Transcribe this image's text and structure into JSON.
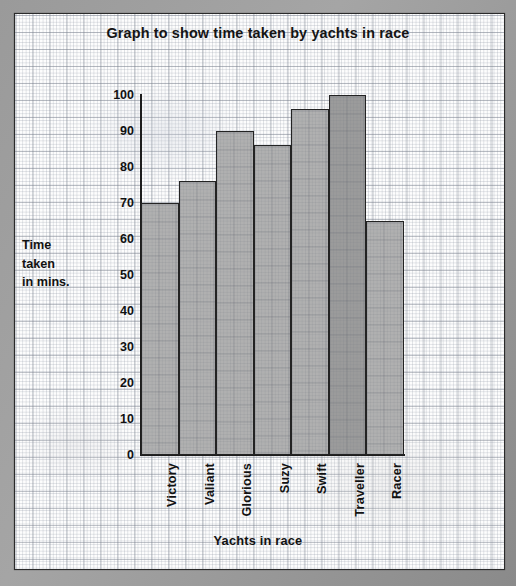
{
  "chart_data": {
    "type": "bar",
    "title": "Graph to show time taken by yachts in race",
    "xlabel": "Yachts in race",
    "ylabel": "Time taken in mins.",
    "ylabel_lines": [
      "Time",
      "taken",
      "in mins."
    ],
    "categories": [
      "Victory",
      "Valiant",
      "Glorious",
      "Suzy",
      "Swift",
      "Traveller",
      "Racer"
    ],
    "values": [
      70,
      76,
      90,
      86,
      96,
      100,
      65
    ],
    "ylim": [
      0,
      100
    ],
    "yticks": [
      0,
      10,
      20,
      30,
      40,
      50,
      60,
      70,
      80,
      90,
      100
    ],
    "ytick_labels": [
      "0",
      "10",
      "20",
      "30",
      "40",
      "50",
      "60",
      "70",
      "80",
      "90",
      "100"
    ],
    "grid": true,
    "grid_style": "graph-paper",
    "legend": null,
    "bar_fill_color": "#b0b0b0",
    "bar_highlight_color": "#9b9b9b",
    "bar_edge_color": "#232323",
    "highlight_category": "Traveller",
    "axis_color": "#1d1d1d",
    "paper_color": "#fdfdfd",
    "backdrop_color": "#8e8e8e"
  }
}
